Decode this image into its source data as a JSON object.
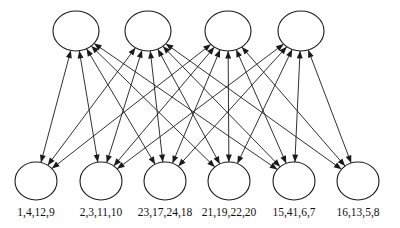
{
  "diagram": {
    "type": "bipartite-directed-graph",
    "title": "",
    "background_color": "#ffffff",
    "stroke_color": "#1a1a1a",
    "node_fill": "#ffffff",
    "top_layer": {
      "name": "top-nodes",
      "count": 4,
      "radius_x": 23,
      "radius_y": 20,
      "center_y": 31,
      "nodes": [
        {
          "id": "t1",
          "cx": 76,
          "cy": 31,
          "label": ""
        },
        {
          "id": "t2",
          "cx": 148,
          "cy": 31,
          "label": ""
        },
        {
          "id": "t3",
          "cx": 228,
          "cy": 31,
          "label": ""
        },
        {
          "id": "t4",
          "cx": 301,
          "cy": 31,
          "label": ""
        }
      ]
    },
    "bottom_layer": {
      "name": "bottom-nodes",
      "count": 6,
      "radius_x": 21,
      "radius_y": 19,
      "center_y": 181,
      "nodes": [
        {
          "id": "b1",
          "cx": 36,
          "cy": 181,
          "label": "1,4,12,9"
        },
        {
          "id": "b2",
          "cx": 101,
          "cy": 181,
          "label": "2,3,11,10"
        },
        {
          "id": "b3",
          "cx": 165,
          "cy": 181,
          "label": "23,17,24,18"
        },
        {
          "id": "b4",
          "cx": 229,
          "cy": 181,
          "label": "21,19,22,20"
        },
        {
          "id": "b5",
          "cx": 294,
          "cy": 181,
          "label": "15,41,6,7"
        },
        {
          "id": "b6",
          "cx": 358,
          "cy": 181,
          "label": "16,13,5,8"
        }
      ]
    },
    "labels": {
      "name": "bottom-node-labels",
      "y": 216,
      "font_size": 11.5,
      "items": [
        "1,4,12,9",
        "2,3,11,10",
        "23,17,24,18",
        "21,19,22,20",
        "15,41,6,7",
        "16,13,5,8"
      ]
    },
    "edges": {
      "description": "Bidirectional arrows connecting every top node to several bottom nodes; arrowheads drawn at both the top-node end and the bottom-node end.",
      "pairs": [
        {
          "top": "t1",
          "bottom": "b1",
          "direction": "both"
        },
        {
          "top": "t1",
          "bottom": "b2",
          "direction": "both"
        },
        {
          "top": "t1",
          "bottom": "b3",
          "direction": "both"
        },
        {
          "top": "t1",
          "bottom": "b4",
          "direction": "both"
        },
        {
          "top": "t1",
          "bottom": "b5",
          "direction": "both"
        },
        {
          "top": "t2",
          "bottom": "b1",
          "direction": "both"
        },
        {
          "top": "t2",
          "bottom": "b2",
          "direction": "both"
        },
        {
          "top": "t2",
          "bottom": "b3",
          "direction": "both"
        },
        {
          "top": "t2",
          "bottom": "b4",
          "direction": "both"
        },
        {
          "top": "t2",
          "bottom": "b5",
          "direction": "both"
        },
        {
          "top": "t2",
          "bottom": "b6",
          "direction": "both"
        },
        {
          "top": "t3",
          "bottom": "b1",
          "direction": "both"
        },
        {
          "top": "t3",
          "bottom": "b2",
          "direction": "both"
        },
        {
          "top": "t3",
          "bottom": "b3",
          "direction": "both"
        },
        {
          "top": "t3",
          "bottom": "b4",
          "direction": "both"
        },
        {
          "top": "t3",
          "bottom": "b5",
          "direction": "both"
        },
        {
          "top": "t3",
          "bottom": "b6",
          "direction": "both"
        },
        {
          "top": "t4",
          "bottom": "b2",
          "direction": "both"
        },
        {
          "top": "t4",
          "bottom": "b3",
          "direction": "both"
        },
        {
          "top": "t4",
          "bottom": "b4",
          "direction": "both"
        },
        {
          "top": "t4",
          "bottom": "b5",
          "direction": "both"
        },
        {
          "top": "t4",
          "bottom": "b6",
          "direction": "both"
        }
      ]
    }
  }
}
